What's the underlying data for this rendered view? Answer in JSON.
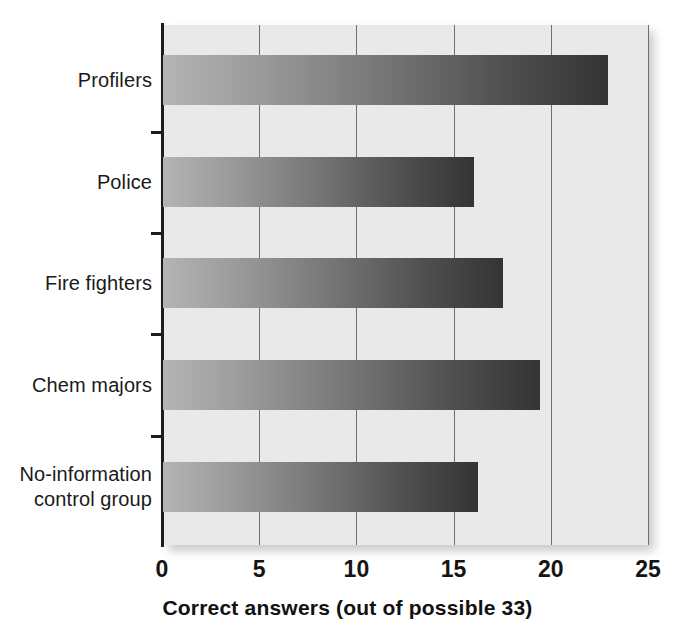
{
  "chart_data": {
    "type": "bar",
    "orientation": "horizontal",
    "title": "",
    "xlabel": "Correct answers (out of possible 33)",
    "ylabel": "",
    "xlim": [
      0,
      25
    ],
    "xticks": [
      0,
      5,
      10,
      15,
      20,
      25
    ],
    "xtick_labels": [
      "0",
      "5",
      "10",
      "15",
      "20",
      "25"
    ],
    "grid": "vertical gridlines at each x tick",
    "legend": "none",
    "categories": [
      "Profilers",
      "Police",
      "Fire fighters",
      "Chem majors",
      "No-information\ncontrol group"
    ],
    "values": [
      22.9,
      16.0,
      17.5,
      19.4,
      16.2
    ],
    "bar_style": {
      "fill": "horizontal gradient light-to-dark gray",
      "gradient_start": "#b4b4b4",
      "gradient_end": "#343434"
    },
    "panel_background": "#e9e9e9",
    "axis_color": "#1c1c1c",
    "gridline_color": "#6f6f6f"
  }
}
